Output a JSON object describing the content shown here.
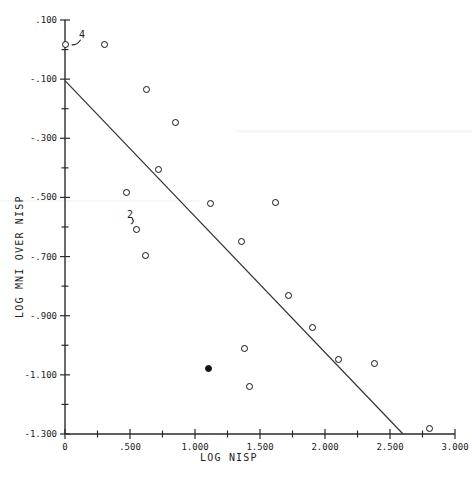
{
  "chart_data": {
    "type": "scatter",
    "title": "",
    "xlabel": "LOG NISP",
    "ylabel": "LOG MNI OVER NISP",
    "xlim": [
      0,
      3.0
    ],
    "ylim": [
      -1.3,
      0.1
    ],
    "grid": false,
    "legend": "none",
    "x_ticks_major": [
      "0",
      ".500",
      "1.000",
      "1.500",
      "2.000",
      "2.500",
      "3.000"
    ],
    "x_tick_values": [
      0,
      0.5,
      1.0,
      1.5,
      2.0,
      2.5,
      3.0
    ],
    "x_minor_step": 0.25,
    "y_ticks_major": [
      ".100",
      "-.100",
      "-.300",
      "-.500",
      "-.700",
      "-.900",
      "-1.100",
      "-1.300"
    ],
    "y_tick_values": [
      0.1,
      -0.1,
      -0.3,
      -0.5,
      -0.7,
      -0.9,
      -1.1,
      -1.3
    ],
    "y_minor_step": 0.1,
    "marker_style": "open-circle",
    "points": [
      {
        "x": 0.0,
        "y": 0.018,
        "label": "4",
        "overlap_count": 4,
        "filled": false
      },
      {
        "x": 0.3,
        "y": 0.018,
        "label": "",
        "overlap_count": 1,
        "filled": false
      },
      {
        "x": 0.63,
        "y": -0.135,
        "label": "",
        "overlap_count": 1,
        "filled": false
      },
      {
        "x": 0.85,
        "y": -0.248,
        "label": "",
        "overlap_count": 1,
        "filled": false
      },
      {
        "x": 0.72,
        "y": -0.404,
        "label": "",
        "overlap_count": 1,
        "filled": false
      },
      {
        "x": 0.47,
        "y": -0.485,
        "label": "",
        "overlap_count": 1,
        "filled": false
      },
      {
        "x": 0.55,
        "y": -0.61,
        "label": "2",
        "overlap_count": 2,
        "filled": false
      },
      {
        "x": 0.62,
        "y": -0.695,
        "label": "",
        "overlap_count": 1,
        "filled": false
      },
      {
        "x": 1.12,
        "y": -0.522,
        "label": "",
        "overlap_count": 1,
        "filled": false
      },
      {
        "x": 1.36,
        "y": -0.65,
        "label": "",
        "overlap_count": 1,
        "filled": false
      },
      {
        "x": 1.62,
        "y": -0.518,
        "label": "",
        "overlap_count": 1,
        "filled": false
      },
      {
        "x": 1.1,
        "y": -1.078,
        "label": "",
        "overlap_count": 1,
        "filled": true
      },
      {
        "x": 1.38,
        "y": -1.01,
        "label": "",
        "overlap_count": 1,
        "filled": false
      },
      {
        "x": 1.42,
        "y": -1.14,
        "label": "",
        "overlap_count": 1,
        "filled": false
      },
      {
        "x": 1.72,
        "y": -0.832,
        "label": "",
        "overlap_count": 1,
        "filled": false
      },
      {
        "x": 1.9,
        "y": -0.94,
        "label": "",
        "overlap_count": 1,
        "filled": false
      },
      {
        "x": 2.1,
        "y": -1.048,
        "label": "",
        "overlap_count": 1,
        "filled": false
      },
      {
        "x": 2.38,
        "y": -1.063,
        "label": "",
        "overlap_count": 1,
        "filled": false
      },
      {
        "x": 2.8,
        "y": -1.282,
        "label": "",
        "overlap_count": 1,
        "filled": false
      }
    ],
    "fit_line": {
      "name": "regression-line",
      "x_start": 0.0,
      "y_start": -0.105,
      "x_end": 2.6,
      "y_end": -1.3,
      "style": "solid"
    },
    "annotations": [
      {
        "text": "4",
        "x": 0.1,
        "y": 0.05,
        "points_to": "origin-cluster"
      },
      {
        "text": "2",
        "x": 0.47,
        "y": -0.56,
        "points_to": "cluster-2"
      }
    ]
  },
  "axis": {
    "x_title": "LOG NISP",
    "y_title": "LOG MNI OVER NISP"
  },
  "colors": {
    "axis": "#2b2b2b",
    "marker_edge": "#111111",
    "marker_fill": "#ffffff",
    "marker_filled": "#111111",
    "line": "#333333",
    "background": "#ffffff"
  }
}
